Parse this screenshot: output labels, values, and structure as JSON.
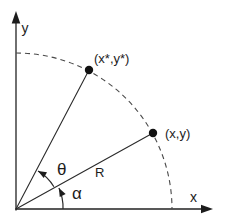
{
  "figure": {
    "background_color": "#ffffff",
    "ink_color": "#222222",
    "dash_color": "#4a4a4a",
    "axes": {
      "x_label": "x",
      "y_label": "y"
    },
    "points": [
      {
        "id": "rotated-point",
        "label": "(x*,y*)"
      },
      {
        "id": "original-point",
        "label": "(x,y)"
      }
    ],
    "angles": [
      {
        "id": "theta",
        "label": "θ"
      },
      {
        "id": "alpha",
        "label": "α"
      }
    ],
    "radius_label": "R"
  }
}
